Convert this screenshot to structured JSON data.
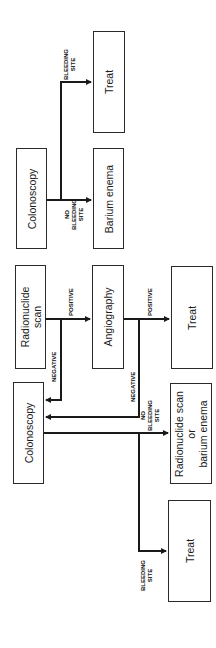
{
  "diagram": {
    "orientation": "rotated 90 degrees (text reads bottom-to-top)",
    "nodes": {
      "radionuclide_scan": {
        "label": "Radionuclide\nscan"
      },
      "angiography": {
        "label": "Angiography"
      },
      "treat_after_angiography": {
        "label": "Treat"
      },
      "colonoscopy_1": {
        "label": "Colonoscopy"
      },
      "radionuclide_or_barium": {
        "label": "Radionuclide scan\nor\nbarium enema"
      },
      "treat_after_colonoscopy_1": {
        "label": "Treat"
      },
      "colonoscopy_2": {
        "label": "Colonoscopy"
      },
      "barium_enema": {
        "label": "Barium enema"
      },
      "treat_after_colonoscopy_2": {
        "label": "Treat"
      }
    },
    "edges": [
      {
        "from": "radionuclide_scan",
        "to": "angiography",
        "label": "POSITIVE"
      },
      {
        "from": "radionuclide_scan",
        "to": "colonoscopy_1",
        "label": "NEGATIVE"
      },
      {
        "from": "angiography",
        "to": "treat_after_angiography",
        "label": "POSITIVE"
      },
      {
        "from": "angiography",
        "to": "colonoscopy_1",
        "label": "NEGATIVE"
      },
      {
        "from": "colonoscopy_1",
        "to": "radionuclide_or_barium",
        "label": "NO\nBLEEDING\nSITE"
      },
      {
        "from": "colonoscopy_1",
        "to": "treat_after_colonoscopy_1",
        "label": "BLEEDING\nSITE"
      },
      {
        "from": "colonoscopy_2",
        "to": "barium_enema",
        "label": "NO\nBLEEDING\nSITE"
      },
      {
        "from": "colonoscopy_2",
        "to": "treat_after_colonoscopy_2",
        "label": "BLEEDING\nSITE"
      }
    ],
    "colors": {
      "line": "#1a1a1a",
      "box_border": "#2a2a2a",
      "background": "#ffffff"
    }
  }
}
